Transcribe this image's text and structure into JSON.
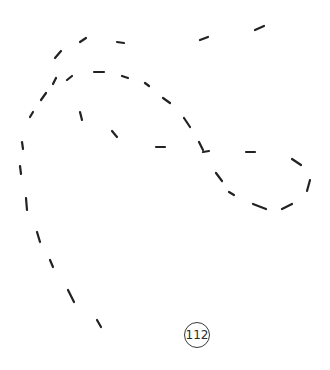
{
  "page": {
    "number": "112",
    "background": "#ffffff",
    "stroke_color": "#222222"
  },
  "drawing": {
    "description": "dashed-line tracing figure (spiral / loop shape)",
    "dashes": [
      [
        80,
        42,
        86,
        38
      ],
      [
        117,
        42,
        124,
        43
      ],
      [
        200,
        40,
        208,
        37
      ],
      [
        255,
        30,
        264,
        26
      ],
      [
        55,
        58,
        61,
        51
      ],
      [
        53,
        84,
        56,
        78
      ],
      [
        67,
        80,
        72,
        76
      ],
      [
        94,
        72,
        104,
        72
      ],
      [
        122,
        76,
        128,
        78
      ],
      [
        145,
        83,
        149,
        86
      ],
      [
        41,
        100,
        46,
        93
      ],
      [
        30,
        117,
        33,
        112
      ],
      [
        80,
        112,
        82,
        120
      ],
      [
        112,
        131,
        117,
        137
      ],
      [
        156,
        147,
        165,
        147
      ],
      [
        163,
        98,
        170,
        103
      ],
      [
        184,
        118,
        190,
        127
      ],
      [
        199,
        142,
        203,
        150
      ],
      [
        203,
        152,
        209,
        151
      ],
      [
        246,
        152,
        255,
        152
      ],
      [
        292,
        159,
        301,
        165
      ],
      [
        310,
        180,
        307,
        191
      ],
      [
        216,
        173,
        222,
        181
      ],
      [
        229,
        192,
        234,
        195
      ],
      [
        253,
        204,
        266,
        209
      ],
      [
        282,
        209,
        292,
        204
      ],
      [
        22,
        142,
        23,
        149
      ],
      [
        20,
        166,
        21,
        174
      ],
      [
        26,
        198,
        27,
        210
      ],
      [
        37,
        232,
        40,
        242
      ],
      [
        50,
        260,
        53,
        267
      ],
      [
        68,
        290,
        74,
        302
      ],
      [
        97,
        320,
        101,
        327
      ]
    ]
  }
}
